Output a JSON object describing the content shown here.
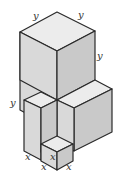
{
  "figure": {
    "colors": {
      "top_face": "#ececec",
      "left_face": "#d9d9d9",
      "right_face": "#c9c9c9",
      "edge": "#2a2a2a"
    },
    "labels": {
      "top_left_y": "y",
      "top_right_y": "y",
      "right_vertical_y": "y",
      "left_vertical_y": "y",
      "small_cube_x": "x",
      "bottom_left_x": "x",
      "bottom_mid_x": "x",
      "bottom_right_x": "x"
    }
  }
}
